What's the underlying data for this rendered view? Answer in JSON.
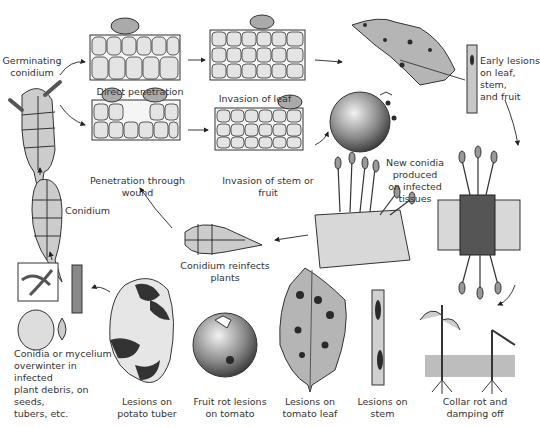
{
  "diagram": {
    "type": "disease-cycle",
    "labels": {
      "germinating_conidium": "Germinating\nconidium",
      "direct_penetration": "Direct penetration",
      "invasion_of_leaf": "Invasion of leaf",
      "early_lesions": "Early lesions\non leaf, stem,\nand fruit",
      "penetration_through_wound": "Penetration through wound",
      "invasion_of_stem_or_fruit": "Invasion of stem or fruit",
      "conidium": "Conidium",
      "new_conidia": "New conidia\nproduced\non infected\ntissues",
      "conidium_reinfects": "Conidium reinfects plants",
      "overwinter": "Conidia or mycelium\noverwinter in infected\nplant debris, on seeds,\ntubers, etc.",
      "lesions_potato": "Lesions on\npotato tuber",
      "fruit_rot": "Fruit rot lesions\non tomato",
      "lesions_tomato_leaf": "Lesions on\ntomato leaf",
      "lesions_stem": "Lesions on stem",
      "collar_rot": "Collar rot and\ndamping off"
    },
    "colors": {
      "ink": "#222222",
      "tissue": "#e4e4e4",
      "lesion": "#2a2a2a",
      "soil": "#bdbdbd",
      "leaf": "#b5b5b5"
    }
  }
}
